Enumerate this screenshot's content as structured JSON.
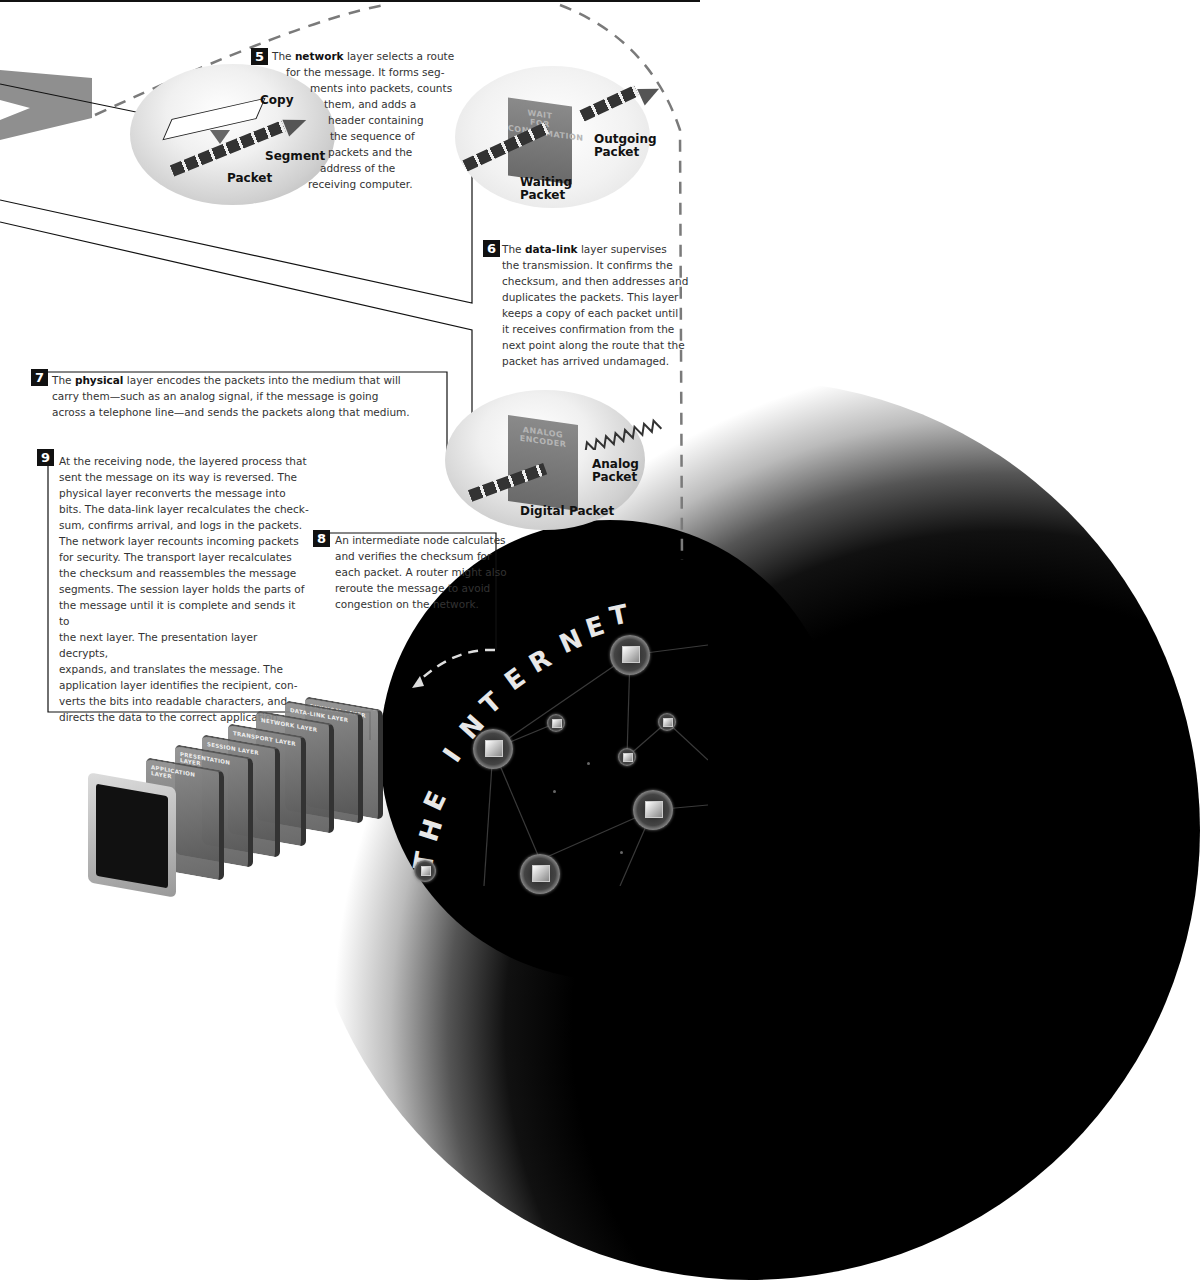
{
  "diagram": {
    "title_letters": [
      "T",
      "H",
      "E",
      "I",
      "N",
      "T",
      "E",
      "R",
      "N",
      "E",
      "T"
    ]
  },
  "steps": {
    "s5": {
      "number": "5",
      "lead": "The ",
      "keyword": "network",
      "lines": [
        "layer selects a route",
        "for the message. It forms seg-",
        "ments into packets, counts",
        "them, and adds a",
        "header containing",
        "the sequence of",
        "packets and the",
        "address of the",
        "receiving computer."
      ]
    },
    "s6": {
      "number": "6",
      "lead": "The ",
      "keyword": "data-link",
      "lines": [
        "layer supervises",
        "the transmission. It confirms the",
        "checksum, and then addresses and",
        "duplicates the packets. This layer",
        "keeps a copy of each packet until",
        "it receives confirmation from the",
        "next point along the route that the",
        "packet has arrived undamaged."
      ]
    },
    "s7": {
      "number": "7",
      "lead": "The ",
      "keyword": "physical",
      "lines": [
        "layer encodes the packets into the medium that will",
        "carry them—such as an analog signal, if the message is going",
        "across a telephone line—and sends the packets along that medium."
      ]
    },
    "s8": {
      "number": "8",
      "lines": [
        "An intermediate node calculates",
        "and verifies the checksum for",
        "each packet. A router might also",
        "reroute the message to avoid",
        "congestion on the network."
      ]
    },
    "s9": {
      "number": "9",
      "lines": [
        "At the receiving node, the layered process that",
        "sent the message on its way is reversed. The",
        "physical layer reconverts the message into",
        "bits. The data-link layer recalculates the check-",
        "sum, confirms arrival, and logs in the packets.",
        "The network layer recounts incoming packets",
        "for security. The transport layer recalculates",
        "the checksum and reassembles the message",
        "segments. The session layer holds the parts of",
        "the message until it is complete and sends it to",
        "the next layer. The presentation layer decrypts,",
        "expands, and translates the message. The",
        "application layer identifies the recipient, con-",
        "verts the bits into readable characters, and",
        "directs the data to the correct application."
      ]
    }
  },
  "scenes": {
    "network": {
      "labels": {
        "copy": "Copy",
        "segment": "Segment",
        "packet": "Packet"
      }
    },
    "datalink": {
      "panel": [
        "WAIT",
        "FOR",
        "CONFIRMATION"
      ],
      "labels": {
        "outgoing": "Outgoing Packet",
        "waiting": "Waiting Packet"
      }
    },
    "physical": {
      "panel": [
        "ANALOG",
        "ENCODER"
      ],
      "labels": {
        "analog": "Analog Packet",
        "digital": "Digital Packet"
      }
    }
  },
  "layer_stack": [
    "APPLICATION LAYER",
    "PRESENTATION LAYER",
    "SESSION LAYER",
    "TRANSPORT LAYER",
    "NETWORK LAYER",
    "DATA-LINK LAYER",
    "PHYSICAL LAYER"
  ],
  "colors": {
    "ink": "#111111",
    "text": "#333333",
    "dash": "#7a7a7a",
    "background": "#ffffff",
    "internet": "#000000"
  }
}
